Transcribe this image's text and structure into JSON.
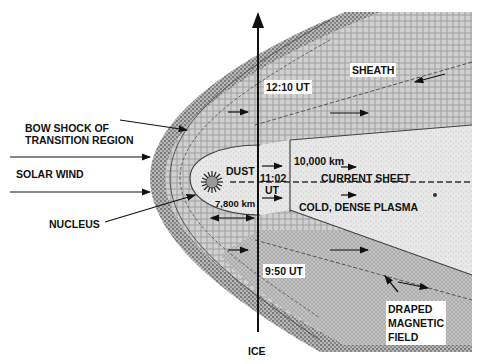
{
  "diagram": {
    "labels": {
      "bow_shock": [
        "BOW SHOCK OF",
        "TRANSITION REGION"
      ],
      "solar_wind": "SOLAR WIND",
      "nucleus": "NUCLEUS",
      "dust": "DUST",
      "sheath": "SHEATH",
      "time_1210": "12:10 UT",
      "time_1102_a": "11:02",
      "time_1102_b": "UT",
      "time_950": "9:50 UT",
      "dist_10000": "10,000 km",
      "dist_7800": "7,800 km",
      "current_sheet": "CURRENT SHEET",
      "cold_plasma": "COLD, DENSE PLASMA",
      "draped_field": [
        "DRAPED",
        "MAGNETIC",
        "FIELD"
      ],
      "ice": "ICE"
    }
  }
}
